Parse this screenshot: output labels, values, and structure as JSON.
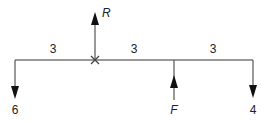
{
  "diagram": {
    "type": "beam-force-diagram",
    "beam": {
      "x1": 15,
      "x2": 253,
      "y": 60,
      "color": "#777777"
    },
    "spans": [
      {
        "label": "3",
        "x": 53
      },
      {
        "label": "3",
        "x": 134
      },
      {
        "label": "3",
        "x": 213
      }
    ],
    "forces": [
      {
        "name": "left-load",
        "label": "6",
        "direction": "down",
        "x": 15
      },
      {
        "name": "reaction",
        "label": "R",
        "direction": "up",
        "x": 95
      },
      {
        "name": "applied-force",
        "label": "F",
        "direction": "up",
        "x": 174
      },
      {
        "name": "right-load",
        "label": "4",
        "direction": "down",
        "x": 253
      }
    ],
    "pivot_marker": {
      "symbol": "×",
      "x": 95,
      "y": 60
    }
  }
}
